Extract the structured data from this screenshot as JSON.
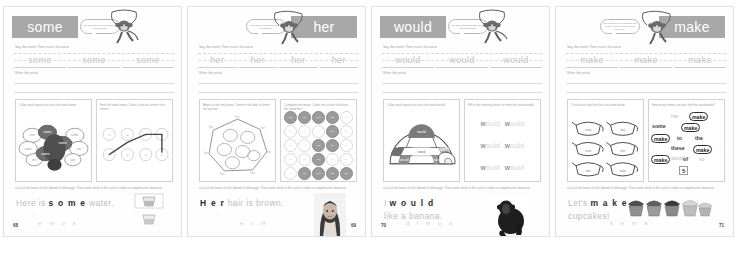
{
  "document": {
    "type": "sight-word workbook scan",
    "spread_count": 4
  },
  "common": {
    "instr_say": "Say the word. Then trace the word.",
    "instr_write": "Write the word.",
    "instr_cut": "Cut out the letters at the bottom of the page. Then paste them in the correct order to complete the sentence."
  },
  "pages": [
    {
      "word": "some",
      "page_number": "68",
      "header_side": "left",
      "bubble_text": "The word some sounds just like the word sum.",
      "trace_words": [
        "some",
        "some",
        "some"
      ],
      "activity_left": {
        "instruction": "Color each space that has the word some.",
        "art": "turkey-blobs",
        "labels": [
          "some",
          "sum",
          "come",
          "some",
          "same",
          "sun",
          "some",
          "me"
        ]
      },
      "activity_right": {
        "instruction": "Find the word some. Draw a line to connect the letters.",
        "art": "letter-dots",
        "letters": [
          "s",
          "o",
          "m",
          "e",
          "n",
          "a",
          "u",
          "s"
        ]
      },
      "sentence_faint_before": "Here is",
      "sentence_solid": "s o m e",
      "sentence_faint_after": "water.",
      "sentence_line2": "",
      "photo": "glass-of-water",
      "cut_letters": "e m o s"
    },
    {
      "word": "her",
      "page_number": "69",
      "header_side": "right",
      "bubble_text": "The word her sounds just like the word fur.",
      "trace_words": [
        "her",
        "her",
        "her",
        "her"
      ],
      "activity_left": {
        "instruction": "Begin at the red arrow. Connect the dots to finish the picture.",
        "art": "connect-dots-polygon",
        "labels": [
          "her",
          "her",
          "her",
          "her",
          "her",
          "her",
          "her",
          "her"
        ]
      },
      "activity_right": {
        "instruction": "Complete the maze. Color the circles that have the word her.",
        "art": "circle-maze",
        "maze": [
          [
            "her",
            "her",
            "her",
            "her",
            "hen"
          ],
          [
            "hre",
            "ehr",
            "reh",
            "her",
            "hre"
          ],
          [
            "erh",
            "hre",
            "her",
            "her",
            "ehr"
          ],
          [
            "hre",
            "erh",
            "her",
            "reh",
            "hre"
          ],
          [
            "ehr",
            "her",
            "her",
            "her",
            "her"
          ]
        ],
        "maze_on": [
          [
            1,
            1,
            1,
            1,
            0
          ],
          [
            0,
            0,
            0,
            1,
            0
          ],
          [
            0,
            0,
            1,
            1,
            0
          ],
          [
            0,
            0,
            1,
            0,
            0
          ],
          [
            0,
            1,
            1,
            1,
            1
          ]
        ]
      },
      "sentence_faint_before": "",
      "sentence_solid": "H e r",
      "sentence_faint_after": "hair is brown.",
      "sentence_line2": "",
      "photo": "girl-with-brown-hair",
      "cut_letters": "e r H"
    },
    {
      "word": "would",
      "page_number": "70",
      "header_side": "left",
      "bubble_text": "The word would sounds just like the word wood.",
      "trace_words": [
        "would",
        "would",
        "would"
      ],
      "activity_left": {
        "instruction": "Color each space that has the word would.",
        "art": "igloo-spaces",
        "labels": [
          "would",
          "wood",
          "could",
          "would",
          "wold",
          "woud",
          "would"
        ]
      },
      "activity_right": {
        "instruction": "Fill in the missing letters to write the word would.",
        "art": "missing-letters",
        "rows": [
          {
            "a": "w",
            "b": "ould",
            "c": "w",
            "d": "ould"
          },
          {
            "a": "w",
            "b": "ould",
            "c": "w",
            "d": "ould"
          },
          {
            "a": "w",
            "b": "ould",
            "c": "w",
            "d": "ould"
          }
        ]
      },
      "sentence_faint_before": "I",
      "sentence_solid": "w o u l d",
      "sentence_faint_after": "",
      "sentence_line2": "like a banana.",
      "photo": "chimpanzee",
      "cut_letters": "d l w o u"
    },
    {
      "word": "make",
      "page_number": "71",
      "header_side": "right",
      "bubble_text": "The letters a-e in make say the long a sound. Make rhymes with cake.",
      "trace_words": [
        "make",
        "make",
        "make"
      ],
      "activity_left": {
        "instruction": "Circle each top that has the word make.",
        "art": "teapot-grid",
        "labels": [
          "make",
          "mak",
          "make",
          "mke",
          "mae",
          "make"
        ]
      },
      "activity_right": {
        "instruction": "How many times can you find the word make?",
        "art": "word-bank",
        "words": [
          {
            "text": "her",
            "style": "faint"
          },
          {
            "text": "make",
            "style": "circled"
          },
          {
            "text": "some",
            "style": "dark"
          },
          {
            "text": "make",
            "style": "circled"
          },
          {
            "text": "make",
            "style": "circled"
          },
          {
            "text": "to",
            "style": "dark"
          },
          {
            "text": "the",
            "style": "dark"
          },
          {
            "text": "these",
            "style": "dark"
          },
          {
            "text": "make",
            "style": "circled"
          },
          {
            "text": "would",
            "style": "faint"
          },
          {
            "text": "make",
            "style": "circled"
          },
          {
            "text": "of",
            "style": "dark"
          },
          {
            "text": "so",
            "style": "faint"
          }
        ],
        "count_answer": "5"
      },
      "sentence_faint_before": "Let's",
      "sentence_solid": "m a k e",
      "sentence_faint_after": "",
      "sentence_line2": "cupcakes!",
      "photo": "cupcakes",
      "cut_letters": "k e m a"
    }
  ]
}
